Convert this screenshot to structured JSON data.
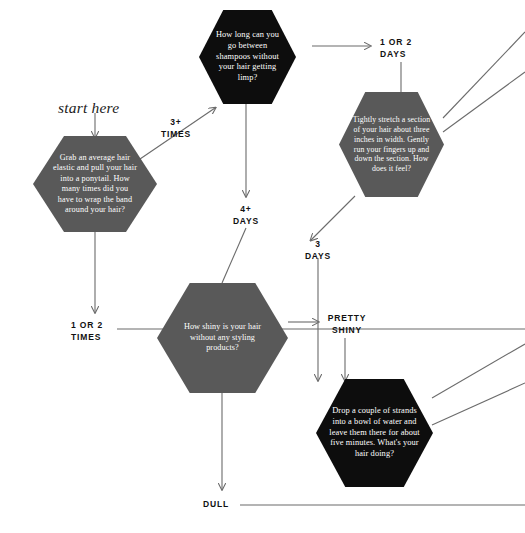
{
  "diagram": {
    "type": "flowchart",
    "start_label": "start here",
    "colors": {
      "dark_node": "#0d0d0d",
      "gray_node": "#595959",
      "edge": "#6b6b6b",
      "text_on_node": "#ffffff",
      "label_text": "#111111",
      "background": "#ffffff"
    },
    "nodes": [
      {
        "id": "ponytail",
        "style": "gray",
        "text": "Grab an average hair elastic and pull your hair into a ponytail. How many times did you have to wrap the band around your hair?"
      },
      {
        "id": "shampoo",
        "style": "dark",
        "text": "How long can you go between shampoos without your hair getting limp?"
      },
      {
        "id": "stretch",
        "style": "gray",
        "text": "Tightly stretch a section of your hair about three inches in width. Gently run your fingers up and down the section. How does it feel?"
      },
      {
        "id": "shiny",
        "style": "gray",
        "text": "How shiny is your hair without any styling products?"
      },
      {
        "id": "water",
        "style": "dark",
        "text": "Drop a couple of strands into a bowl of water and leave them there for about five minutes. What's your hair doing?"
      }
    ],
    "edge_labels": [
      {
        "id": "three-plus-times",
        "line1": "3+",
        "line2": "TIMES"
      },
      {
        "id": "one-or-two-times",
        "line1": "1 OR 2",
        "line2": "TIMES"
      },
      {
        "id": "one-or-two-days",
        "line1": "1 OR 2",
        "line2": "DAYS"
      },
      {
        "id": "four-plus-days",
        "line1": "4+",
        "line2": "DAYS"
      },
      {
        "id": "three-days",
        "line1": "3",
        "line2": "DAYS"
      },
      {
        "id": "pretty-shiny",
        "line1": "PRETTY",
        "line2": "SHINY"
      },
      {
        "id": "dull",
        "line1": "DULL",
        "line2": ""
      }
    ]
  }
}
